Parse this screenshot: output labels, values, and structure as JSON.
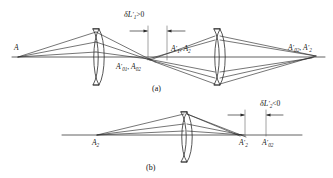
{
  "figure": {
    "stroke_color": "#2b2b2b",
    "axis_color": "#3a3a3a",
    "background": "#ffffff"
  },
  "panels": [
    {
      "id": "a",
      "caption": "(a)",
      "annotation": {
        "symbol": "δL",
        "prime": "′",
        "subscript": "1",
        "relation": ">0",
        "full": "δL′1>0",
        "sign": "positive"
      },
      "labels": [
        {
          "name": "object-point-A",
          "symbol": "A",
          "prime": "",
          "subscript": "",
          "full": "A"
        },
        {
          "name": "image-point-A01-A02",
          "symbol": "A",
          "prime": "′",
          "subscript": "01",
          "second_symbol": "A",
          "second_subscript": "02",
          "full": "A′01, A02"
        },
        {
          "name": "image-point-A1-A2",
          "symbol": "A",
          "prime": "′",
          "subscript": "1",
          "second_symbol": "A",
          "second_subscript": "2",
          "full": "A′1, A2"
        },
        {
          "name": "image-point-A02-A2-final",
          "symbol": "A",
          "prime": "′",
          "subscript": "02",
          "second_symbol": "A",
          "second_prime": "′",
          "second_subscript": "2",
          "full": "A′02, A′2"
        }
      ],
      "lenses": [
        {
          "name": "lens-1",
          "type": "biconvex"
        },
        {
          "name": "lens-2",
          "type": "biconvex"
        }
      ]
    },
    {
      "id": "b",
      "caption": "(b)",
      "annotation": {
        "symbol": "δL",
        "prime": "′",
        "subscript": "2",
        "relation": "<0",
        "full": "δL′2<0",
        "sign": "negative"
      },
      "labels": [
        {
          "name": "object-point-A2",
          "symbol": "A",
          "prime": "",
          "subscript": "2",
          "full": "A2"
        },
        {
          "name": "image-point-A2-prime",
          "symbol": "A",
          "prime": "′",
          "subscript": "2",
          "full": "A′2"
        },
        {
          "name": "image-point-A02-prime",
          "symbol": "A",
          "prime": "′",
          "subscript": "02",
          "full": "A′02"
        }
      ],
      "lenses": [
        {
          "name": "lens-3",
          "type": "biconvex"
        }
      ]
    }
  ]
}
